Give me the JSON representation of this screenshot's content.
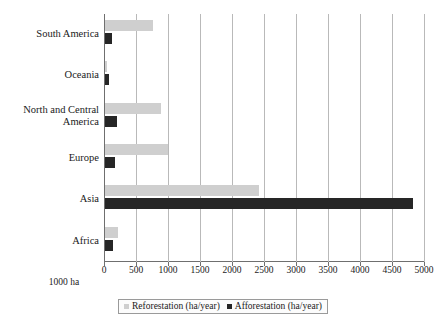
{
  "chart_data": {
    "type": "bar",
    "orientation": "horizontal",
    "title": "",
    "xlabel": "1000 ha",
    "ylabel": "",
    "xlim": [
      0,
      5000
    ],
    "xticks": [
      0,
      500,
      1000,
      1500,
      2000,
      2500,
      3000,
      3500,
      4000,
      4500,
      5000
    ],
    "xtick_labels": [
      "0",
      "500",
      "1000",
      "1500",
      "2000",
      "2500",
      "3000",
      "3500",
      "4000",
      "4500",
      "5000"
    ],
    "grid": "vertical",
    "legend_position": "bottom",
    "categories": [
      "South America",
      "Oceania",
      "North and Central\nAmerica",
      "Europe",
      "Asia",
      "Africa"
    ],
    "series": [
      {
        "name": "Reforestation (ha/year)",
        "color": "#cfcfcf",
        "values": [
          750,
          30,
          870,
          985,
          2400,
          200
        ]
      },
      {
        "name": "Afforestation (ha/year)",
        "color": "#262626",
        "values": [
          110,
          60,
          180,
          150,
          4820,
          130
        ]
      }
    ]
  },
  "legend": {
    "items": [
      {
        "label": "Reforestation (ha/year)",
        "color": "#cfcfcf"
      },
      {
        "label": "Afforestation (ha/year)",
        "color": "#262626"
      }
    ]
  }
}
